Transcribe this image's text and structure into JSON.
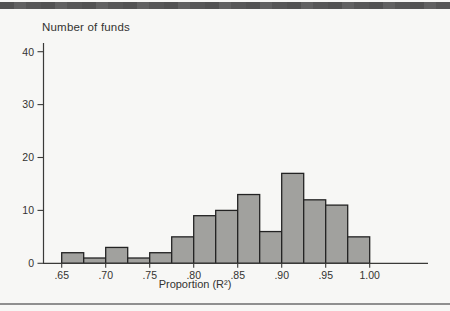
{
  "page": {
    "top_bar_color": "#575757",
    "bottom_rule_color": "#8f8f8f",
    "background": "#f7f7f5"
  },
  "chart_data": {
    "type": "bar",
    "subtype": "histogram",
    "title": "Number of funds",
    "xlabel": "Proportion (R²)",
    "ylabel": "Number of funds",
    "grid": false,
    "legend": null,
    "xlim": [
      0.65,
      1.0
    ],
    "ylim": [
      0,
      40
    ],
    "bin_width": 0.025,
    "categories": [
      ".650–.675",
      ".675–.700",
      ".700–.725",
      ".725–.750",
      ".750–.775",
      ".775–.800",
      ".800–.825",
      ".825–.850",
      ".850–.875",
      ".875–.900",
      ".900–.925",
      ".925–.950",
      ".950–.975",
      ".975–1.000"
    ],
    "values": [
      2,
      1,
      3,
      1,
      2,
      5,
      9,
      10,
      13,
      6,
      17,
      12,
      11,
      5
    ],
    "x_tick_labels": [
      ".65",
      ".70",
      ".75",
      ".80",
      ".85",
      ".90",
      ".95",
      "1.00"
    ],
    "x_tick_values": [
      0.65,
      0.7,
      0.75,
      0.8,
      0.85,
      0.9,
      0.95,
      1.0
    ],
    "y_tick_labels": [
      "0",
      "10",
      "20",
      "30",
      "40"
    ],
    "y_tick_values": [
      0,
      10,
      20,
      30,
      40
    ],
    "bar_fill": "#a1a19e",
    "bar_stroke": "#232323",
    "axis_color": "#3a3a38",
    "label_color": "#333331"
  }
}
